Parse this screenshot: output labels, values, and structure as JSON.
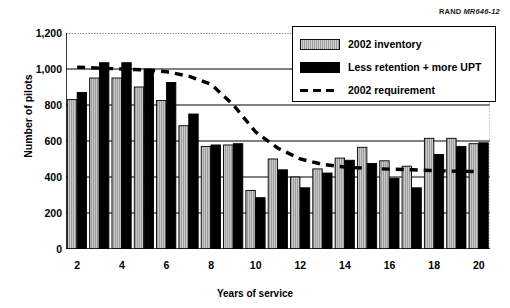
{
  "source_credit": {
    "prefix": "RAND",
    "code": "MR646-12"
  },
  "chart_data": {
    "type": "bar",
    "title": "",
    "subtitle": "",
    "xlabel": "Years of service",
    "ylabel": "Number of pilots",
    "categories": [
      2,
      3,
      4,
      5,
      6,
      7,
      8,
      9,
      10,
      11,
      12,
      13,
      14,
      15,
      16,
      17,
      18,
      19,
      20
    ],
    "xtick_labels": [
      "2",
      "4",
      "6",
      "8",
      "10",
      "12",
      "14",
      "16",
      "18",
      "20"
    ],
    "xtick_values": [
      2,
      4,
      6,
      8,
      10,
      12,
      14,
      16,
      18,
      20
    ],
    "ytick_labels": [
      "0",
      "200",
      "400",
      "600",
      "800",
      "1,000",
      "1,200"
    ],
    "ytick_values": [
      0,
      200,
      400,
      600,
      800,
      1000,
      1200
    ],
    "ylim": [
      0,
      1200
    ],
    "xlim": [
      1.5,
      20.5
    ],
    "grid": true,
    "grid_axis": "y",
    "legend_position": "top-right",
    "series": [
      {
        "name": "2002 inventory",
        "type": "bar",
        "color": "#9d9d9d",
        "values": [
          830,
          950,
          950,
          900,
          825,
          685,
          570,
          578,
          325,
          500,
          400,
          445,
          505,
          565,
          490,
          460,
          615,
          615,
          585
        ]
      },
      {
        "name": "Less retention + more UPT",
        "type": "bar",
        "color": "#000000",
        "values": [
          870,
          1035,
          1035,
          1000,
          925,
          750,
          578,
          585,
          285,
          440,
          340,
          422,
          493,
          475,
          393,
          340,
          525,
          570,
          590
        ]
      },
      {
        "name": "2002 requirement",
        "type": "line",
        "style": "dashed",
        "color": "#000000",
        "values": [
          1010,
          1005,
          1000,
          995,
          985,
          960,
          915,
          800,
          650,
          560,
          500,
          470,
          455,
          448,
          444,
          440,
          436,
          432,
          430
        ]
      }
    ],
    "annotations": []
  },
  "legend": {
    "items": [
      {
        "label": "2002 inventory",
        "swatch": "gray-bar-swatch"
      },
      {
        "label": "Less retention + more UPT",
        "swatch": "black-bar-swatch"
      },
      {
        "label": "2002 requirement",
        "swatch": "dashed-line-swatch"
      }
    ]
  }
}
